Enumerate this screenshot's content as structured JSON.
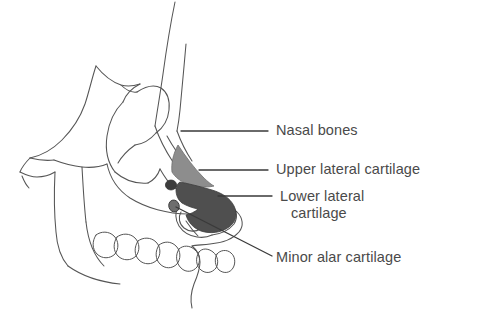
{
  "figure": {
    "background_color": "#ffffff",
    "line_color": "#555555",
    "text_color": "#4a4a4a"
  },
  "anatomy": {
    "structures": [
      {
        "id": "nasal-bones",
        "label": "Nasal bones",
        "fill": "none",
        "shading": "unshaded outline",
        "leader": "horizontal line from nasal dorsum to text"
      },
      {
        "id": "upper-lateral-cartilage",
        "label": "Upper lateral cartilage",
        "fill": "#8a8a8a",
        "shading": "light gray triangle",
        "leader": "horizontal line from cartilage to text"
      },
      {
        "id": "lower-lateral-cartilage",
        "label": "Lower lateral cartilage",
        "label_line2": "cartilage",
        "fill": "#4f4f4f",
        "shading": "dark gray hooked shape",
        "leader": "horizontal line from cartilage to text"
      },
      {
        "id": "minor-alar-cartilage",
        "label": "Minor alar cartilage",
        "fill": "#3d3d3d",
        "shading": "small dark ovals near nostril rim",
        "leader": "long diagonal line from alar rim down to text"
      }
    ]
  },
  "labels": {
    "nasal_bones": "Nasal bones",
    "upper_lateral_cartilage": "Upper lateral cartilage",
    "lower_lateral_cartilage_line1": "Lower lateral",
    "lower_lateral_cartilage_line2": "cartilage",
    "minor_alar_cartilage": "Minor alar cartilage"
  }
}
